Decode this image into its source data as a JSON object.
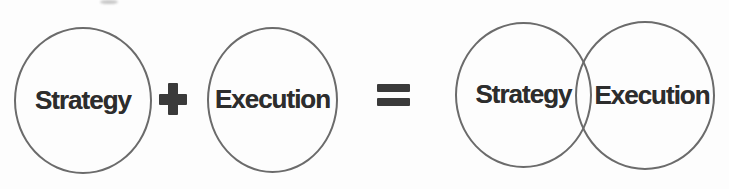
{
  "diagram": {
    "lhs": {
      "circles": [
        {
          "label": "Strategy"
        },
        {
          "label": "Execution"
        }
      ],
      "operator": "+",
      "operator_icon": "plus-icon"
    },
    "relation": "=",
    "relation_icon": "equals-icon",
    "rhs": {
      "circles": [
        {
          "label": "Strategy"
        },
        {
          "label": "Execution"
        }
      ],
      "overlap": true
    },
    "colors": {
      "stroke": "#6b6b6b",
      "text": "#2d2d2d",
      "symbol": "#3a3a3a",
      "background": "#fdfdfd"
    }
  }
}
